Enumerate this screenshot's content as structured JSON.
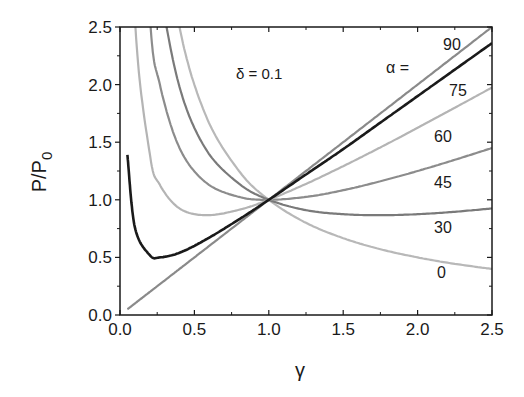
{
  "chart_data": {
    "type": "line",
    "title": "",
    "xlabel": "γ",
    "ylabel": "P/P",
    "ylabel_subscript": "0",
    "xlim": [
      0,
      2.5
    ],
    "ylim": [
      0,
      2.5
    ],
    "grid": false,
    "x_ticks": [
      "0.0",
      "0.5",
      "1.0",
      "1.5",
      "2.0",
      "2.5"
    ],
    "y_ticks": [
      "0.0",
      "0.5",
      "1.0",
      "1.5",
      "2.0",
      "2.5"
    ],
    "annotations": {
      "delta": "δ = 0.1",
      "alpha_header": "α ="
    },
    "x": [
      0.05,
      0.1,
      0.2,
      0.268,
      0.4,
      0.577,
      0.8,
      1.0,
      1.25,
      1.5,
      1.75,
      2.0,
      2.25,
      2.5
    ],
    "series": [
      {
        "name": "0",
        "label": "0",
        "color": "#b8b8b8",
        "values": [
          20.0,
          10.0,
          5.0,
          3.73,
          2.5,
          1.73,
          1.25,
          1.0,
          0.8,
          0.667,
          0.571,
          0.5,
          0.444,
          0.4
        ]
      },
      {
        "name": "30",
        "label": "30",
        "color": "#7a7a7a",
        "values": [
          15.01,
          7.53,
          3.8,
          2.87,
          1.98,
          1.44,
          1.14,
          1.0,
          0.91,
          0.875,
          0.866,
          0.875,
          0.896,
          0.925
        ]
      },
      {
        "name": "45",
        "label": "45",
        "color": "#8c8c8c",
        "values": [
          10.03,
          5.05,
          2.6,
          2.0,
          1.45,
          1.15,
          1.025,
          1.0,
          1.025,
          1.083,
          1.161,
          1.25,
          1.347,
          1.45
        ]
      },
      {
        "name": "60",
        "label": "60",
        "color": "#b4b4b4",
        "values": [
          5.04,
          2.58,
          1.4,
          1.13,
          0.925,
          0.866,
          0.913,
          1.0,
          1.138,
          1.292,
          1.455,
          1.625,
          1.799,
          1.975
        ]
      },
      {
        "name": "75",
        "label": "75",
        "color": "#1a1a1a",
        "values": [
          1.39,
          0.76,
          0.52,
          0.5,
          0.54,
          0.655,
          0.83,
          1.0,
          1.22,
          1.44,
          1.67,
          1.9,
          2.13,
          2.36
        ]
      },
      {
        "name": "90",
        "label": "90",
        "color": "#8a8a8a",
        "values": [
          0.05,
          0.1,
          0.2,
          0.268,
          0.4,
          0.577,
          0.8,
          1.0,
          1.25,
          1.5,
          1.75,
          2.0,
          2.25,
          2.5
        ]
      }
    ],
    "model_note_visible": false
  }
}
